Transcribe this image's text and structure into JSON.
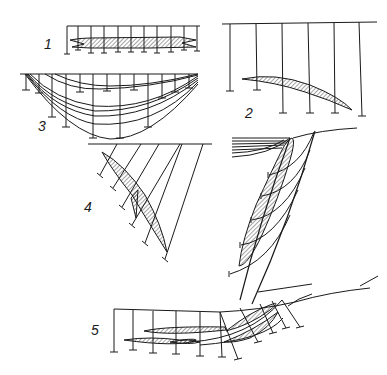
{
  "figure": {
    "panels": [
      {
        "id": "1",
        "label": "1"
      },
      {
        "id": "2",
        "label": "2"
      },
      {
        "id": "3",
        "label": "3"
      },
      {
        "id": "4",
        "label": "4"
      },
      {
        "id": "5",
        "label": "5"
      }
    ],
    "colors": {
      "ink": "#1a1a1a",
      "background": "#ffffff"
    }
  }
}
